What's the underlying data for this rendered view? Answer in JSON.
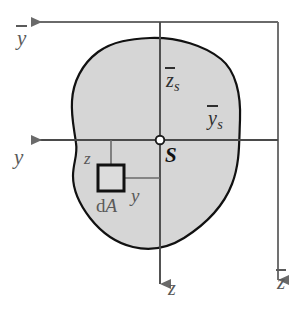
{
  "figure": {
    "type": "engineering-statics-diagram",
    "colors": {
      "area_fill": "#d6d6d6",
      "area_outline": "#111111",
      "axis": "#6a6a6a",
      "label": "#5a5a5a",
      "element_outline": "#111111",
      "background": "#ffffff"
    }
  },
  "labels": {
    "y_bar_axis": "y",
    "z_bar_axis": "z",
    "y_axis": "y",
    "z_axis": "z",
    "z_s": "z",
    "z_s_sub": "s",
    "y_s": "y",
    "y_s_sub": "s",
    "centroid": "S",
    "z_distance": "z",
    "y_distance": "y",
    "area_element_d": "d",
    "area_element_A": "A"
  },
  "geometry": {
    "centroid_point": {
      "x": 160,
      "y": 140
    },
    "axis_y_horizontal_y": 140,
    "axis_z_vertical_x": 160,
    "axis_ybar_horizontal_y": 22,
    "axis_zbar_vertical_x": 278,
    "element_square": {
      "x": 98,
      "y": 165,
      "size": 26
    },
    "element_center": {
      "x": 111,
      "y": 178
    }
  }
}
